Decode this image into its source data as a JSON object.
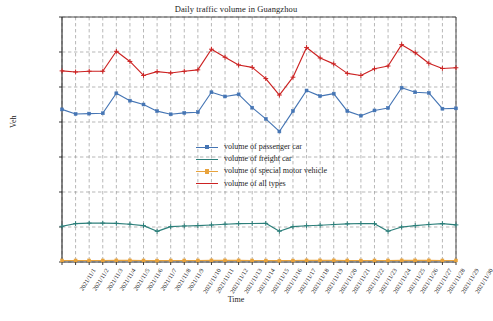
{
  "chart_data": {
    "type": "line",
    "title": "Daily traffic volume in Guangzhou",
    "xlabel": "Time",
    "ylabel": "Veh",
    "grid": true,
    "legend_position": "center",
    "ylim": [
      0,
      3500000
    ],
    "ytick_values": [
      0,
      500000,
      1000000,
      1500000,
      2000000,
      2500000,
      3000000,
      3500000
    ],
    "ytick_labels": [
      "0",
      "500000",
      "1000000",
      "1500000",
      "2000000",
      "2500000",
      "3000000",
      "3500000"
    ],
    "categories": [
      "2021/11/1",
      "2021/11/2",
      "2021/11/3",
      "2021/11/4",
      "2021/11/5",
      "2021/11/6",
      "2021/11/7",
      "2021/11/8",
      "2021/11/9",
      "2021/11/10",
      "2021/11/11",
      "2021/11/12",
      "2021/11/13",
      "2021/11/14",
      "2021/11/15",
      "2021/11/16",
      "2021/11/17",
      "2021/11/18",
      "2021/11/19",
      "2021/11/20",
      "2021/11/21",
      "2021/11/22",
      "2021/11/23",
      "2021/11/24",
      "2021/11/25",
      "2021/11/26",
      "2021/11/27",
      "2021/11/28",
      "2021/11/29",
      "2021/11/30"
    ],
    "series": [
      {
        "name": "volume of passenger car",
        "color": "#4575b4",
        "marker": "square",
        "values": [
          2180000,
          2115000,
          2120000,
          2125000,
          2410000,
          2305000,
          2250000,
          2155000,
          2110000,
          2130000,
          2140000,
          2425000,
          2365000,
          2395000,
          2205000,
          2045000,
          1865000,
          2155000,
          2450000,
          2370000,
          2405000,
          2155000,
          2090000,
          2165000,
          2200000,
          2490000,
          2425000,
          2415000,
          2190000,
          2195000
        ]
      },
      {
        "name": "volume of freight car",
        "color": "#2c7f7a",
        "marker": "plus",
        "values": [
          510000,
          548000,
          555000,
          555000,
          552000,
          540000,
          520000,
          438000,
          505000,
          515000,
          520000,
          528000,
          540000,
          548000,
          550000,
          552000,
          440000,
          505000,
          518000,
          525000,
          535000,
          545000,
          550000,
          548000,
          440000,
          500000,
          520000,
          535000,
          548000,
          530000
        ]
      },
      {
        "name": "volume of special motor vehicle",
        "color": "#e8a33d",
        "marker": "square",
        "values": [
          22000,
          22000,
          22000,
          22000,
          23000,
          23000,
          22000,
          20000,
          22000,
          22000,
          22000,
          23000,
          23000,
          23000,
          22000,
          21000,
          19000,
          21000,
          23000,
          23000,
          23000,
          22000,
          21000,
          22000,
          22000,
          23000,
          23000,
          23000,
          22000,
          22000
        ]
      },
      {
        "name": "volume of all types",
        "color": "#cc2222",
        "marker": "plus",
        "values": [
          2730000,
          2715000,
          2725000,
          2725000,
          3010000,
          2865000,
          2665000,
          2720000,
          2700000,
          2725000,
          2745000,
          3040000,
          2925000,
          2815000,
          2780000,
          2620000,
          2385000,
          2640000,
          3065000,
          2915000,
          2830000,
          2695000,
          2665000,
          2760000,
          2800000,
          3105000,
          2990000,
          2840000,
          2765000,
          2775000
        ]
      }
    ]
  }
}
